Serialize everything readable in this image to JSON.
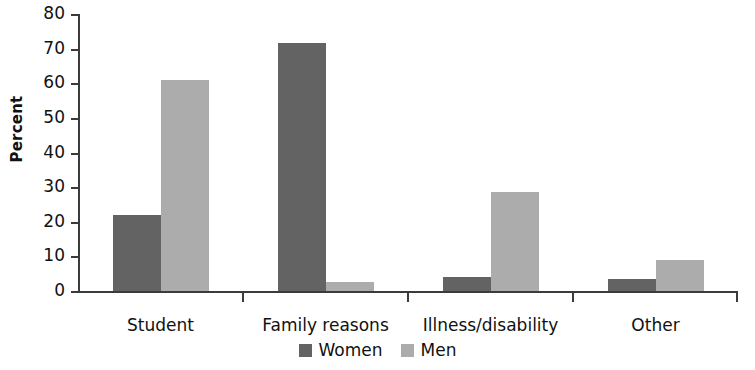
{
  "chart_data": {
    "type": "bar",
    "title": "",
    "xlabel": "",
    "ylabel": "Percent",
    "ylim": [
      0,
      80
    ],
    "yticks": [
      0,
      10,
      20,
      30,
      40,
      50,
      60,
      70,
      80
    ],
    "grid": false,
    "legend_position": "bottom-center",
    "categories": [
      "Student",
      "Family reasons",
      "Illness/disability",
      "Other"
    ],
    "series": [
      {
        "name": "Women",
        "color": "#636363",
        "values": [
          22,
          71.5,
          4,
          3.5
        ]
      },
      {
        "name": "Men",
        "color": "#acacac",
        "values": [
          61,
          2.5,
          28.5,
          9
        ]
      }
    ]
  },
  "axis": {
    "y_title": "Percent",
    "y_tick_labels": [
      "80",
      "70",
      "60",
      "50",
      "40",
      "30",
      "20",
      "10",
      "0"
    ]
  },
  "legend": {
    "items": [
      {
        "label": "Women",
        "color": "#636363"
      },
      {
        "label": "Men",
        "color": "#acacac"
      }
    ]
  }
}
